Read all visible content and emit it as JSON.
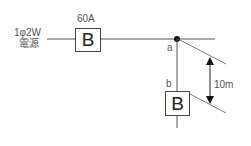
{
  "source": {
    "line1": "1φ2W",
    "line2": "電源"
  },
  "main_breaker": {
    "rating": "60A",
    "symbol": "B"
  },
  "branch_breaker": {
    "symbol": "B"
  },
  "points": {
    "a": "a",
    "b": "b"
  },
  "dimension": {
    "length": "10m"
  }
}
